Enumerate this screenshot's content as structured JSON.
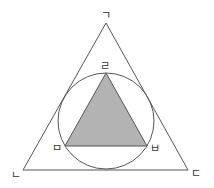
{
  "diagram": {
    "outer_triangle": {
      "vertices": [
        {
          "label": "ㄱ",
          "x": 106,
          "y": 23,
          "label_x": 106,
          "label_y": 15
        },
        {
          "label": "ㄴ",
          "x": 23,
          "y": 170,
          "label_x": 16,
          "label_y": 175
        },
        {
          "label": "ㄷ",
          "x": 188,
          "y": 170,
          "label_x": 196,
          "label_y": 173
        }
      ],
      "stroke": "#555555"
    },
    "circle": {
      "cx": 106,
      "cy": 121,
      "r": 48,
      "stroke": "#555555"
    },
    "inner_triangle": {
      "vertices": [
        {
          "label": "ㄹ",
          "x": 106,
          "y": 73,
          "label_x": 105,
          "label_y": 66
        },
        {
          "label": "ㅁ",
          "x": 65,
          "y": 146,
          "label_x": 57,
          "label_y": 148
        },
        {
          "label": "ㅂ",
          "x": 147,
          "y": 146,
          "label_x": 155,
          "label_y": 148
        }
      ],
      "fill": "#b3b3b3",
      "stroke": "#555555"
    }
  }
}
